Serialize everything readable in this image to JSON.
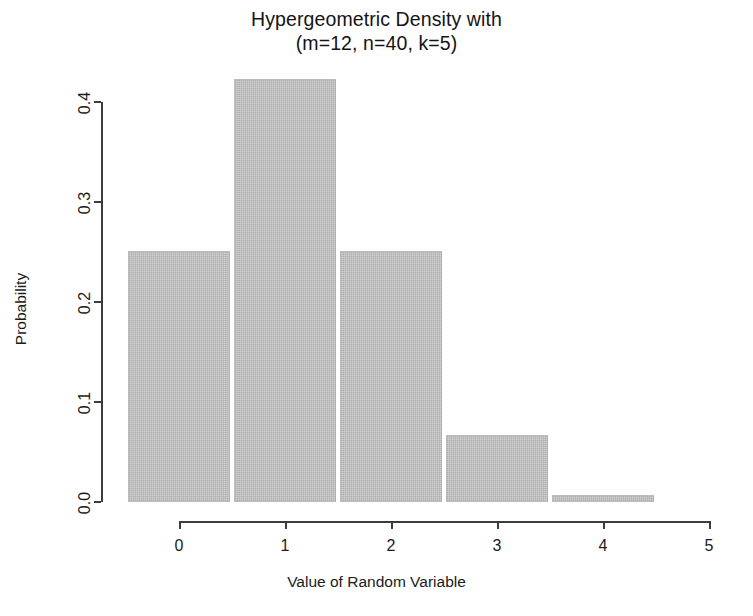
{
  "chart_data": {
    "type": "bar",
    "title": "Hypergeometric Density with (m=12, n=40, k=5)",
    "title_lines": [
      "Hypergeometric Density with",
      "(m=12, n=40, k=5)"
    ],
    "xlabel": "Value of Random Variable",
    "ylabel": "Probability",
    "categories": [
      "0",
      "1",
      "2",
      "3",
      "4"
    ],
    "x": [
      0,
      1,
      2,
      3,
      4
    ],
    "values": [
      0.251,
      0.423,
      0.251,
      0.067,
      0.007
    ],
    "xlim": [
      -0.5,
      5.0
    ],
    "ylim": [
      0.0,
      0.4
    ],
    "x_ticks": [
      "0",
      "1",
      "2",
      "3",
      "4",
      "5"
    ],
    "x_tick_values": [
      0,
      1,
      2,
      3,
      4,
      5
    ],
    "y_ticks": [
      "0.0",
      "0.1",
      "0.2",
      "0.3",
      "0.4"
    ],
    "y_tick_values": [
      0.0,
      0.1,
      0.2,
      0.3,
      0.4
    ],
    "grid": false,
    "legend": false,
    "bar_color": "#c2c2c2",
    "axis_color": "#3d3d3d",
    "bar_width_units": 0.97
  }
}
